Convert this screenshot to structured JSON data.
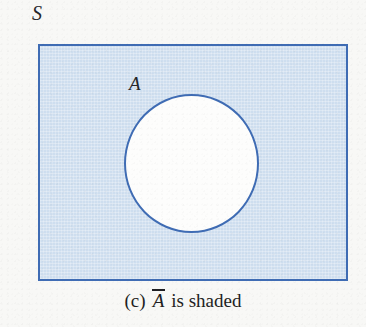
{
  "figure": {
    "type": "venn-diagram",
    "universe": {
      "label": "S",
      "shape": "rectangle",
      "shaded": true,
      "fill_color": "#cedeef",
      "stroke_color": "#3f6cb4",
      "bounds": {
        "x": 38,
        "y": 44,
        "width": 310,
        "height": 237
      }
    },
    "sets": [
      {
        "label": "A",
        "shape": "circle",
        "shaded": false,
        "fill_color": "#fdfdfc",
        "stroke_color": "#3f6cb4",
        "bounds": {
          "x": 124,
          "y": 94,
          "width": 135,
          "height": 139
        }
      }
    ],
    "shaded_region": "complement of A"
  },
  "caption": {
    "index": "(c)",
    "symbol": "A",
    "symbol_has_overline": true,
    "tail": "is shaded",
    "full_text": "(c) Ā is shaded"
  },
  "colors": {
    "page_background": "#f8f8f6",
    "shading": "#cedeef",
    "outline": "#3f6cb4",
    "text": "#1f1f23"
  }
}
